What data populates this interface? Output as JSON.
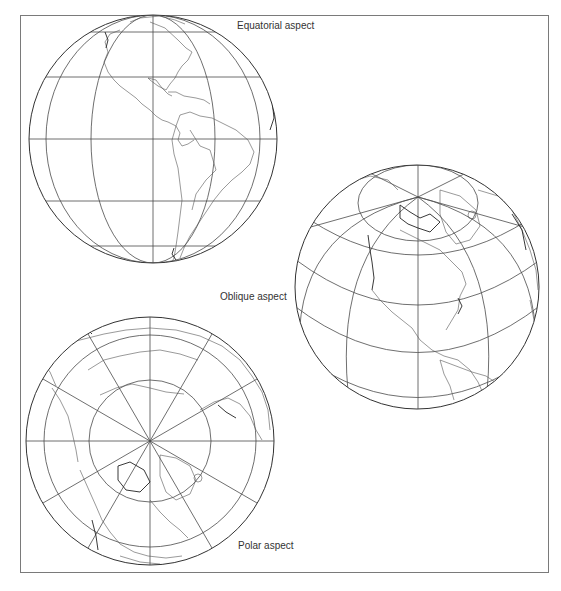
{
  "figure": {
    "labels": {
      "equatorial": "Equatorial aspect",
      "oblique": "Oblique aspect",
      "polar": "Polar aspect"
    }
  },
  "globes": [
    {
      "name": "equatorial",
      "projection": "orthographic",
      "center": [
        153,
        139
      ],
      "radius": 124,
      "view": "Americas, equator centered"
    },
    {
      "name": "oblique",
      "projection": "orthographic",
      "center": [
        417,
        287
      ],
      "radius": 122,
      "view": "North America, tilted toward North Pole"
    },
    {
      "name": "polar",
      "projection": "orthographic",
      "center": [
        150,
        441
      ],
      "radius": 124,
      "view": "North Pole centered"
    }
  ],
  "colors": {
    "line": "#4a4a4a",
    "frame": "#7a7a7a",
    "background": "#ffffff"
  }
}
